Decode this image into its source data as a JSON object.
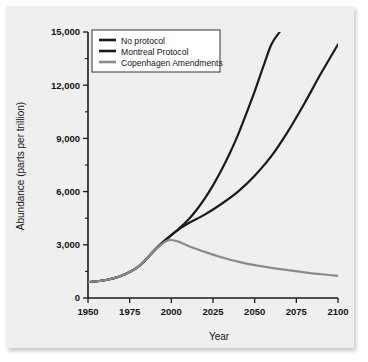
{
  "chart_data": {
    "type": "line",
    "title": "",
    "xlabel": "Year",
    "ylabel": "Abundance (parts per trillion)",
    "xlim": [
      1950,
      2100
    ],
    "ylim": [
      0,
      15000
    ],
    "grid": false,
    "legend_position": "top-left",
    "x_ticks": [
      "1950",
      "1975",
      "2000",
      "2025",
      "2050",
      "2075",
      "2100"
    ],
    "x_tick_values": [
      1950,
      1975,
      2000,
      2025,
      2050,
      2075,
      2100
    ],
    "y_ticks": [
      "0",
      "3,000",
      "6,000",
      "9,000",
      "12,000",
      "15,000"
    ],
    "y_tick_values": [
      0,
      3000,
      6000,
      9000,
      12000,
      15000
    ],
    "y_minor_tick_values": [
      1500,
      4500,
      7500,
      10500,
      13500
    ],
    "series": [
      {
        "name": "No protocol",
        "color": "#1a1a1a",
        "width": 2.2,
        "x": [
          1950,
          1960,
          1970,
          1980,
          1990,
          1995,
          2000,
          2005,
          2010,
          2015,
          2020,
          2025,
          2030,
          2035,
          2040,
          2045,
          2050,
          2055,
          2060,
          2065
        ],
        "values": [
          900,
          1000,
          1250,
          1750,
          2700,
          3150,
          3550,
          3950,
          4400,
          4950,
          5600,
          6350,
          7200,
          8150,
          9200,
          10400,
          11650,
          13000,
          14300,
          15000
        ]
      },
      {
        "name": "Montreal Protocol",
        "color": "#1a1a1a",
        "width": 2.2,
        "x": [
          1950,
          1960,
          1970,
          1980,
          1990,
          1995,
          2000,
          2005,
          2010,
          2020,
          2030,
          2040,
          2050,
          2060,
          2070,
          2080,
          2090,
          2100
        ],
        "values": [
          900,
          1000,
          1250,
          1750,
          2700,
          3150,
          3550,
          3900,
          4200,
          4700,
          5300,
          6000,
          6900,
          8000,
          9400,
          11000,
          12700,
          14300
        ]
      },
      {
        "name": "Copenhagen Amendments",
        "color": "#8a8a8a",
        "width": 2.2,
        "x": [
          1950,
          1960,
          1970,
          1980,
          1990,
          1995,
          1998,
          2000,
          2005,
          2010,
          2020,
          2030,
          2040,
          2050,
          2060,
          2070,
          2080,
          2090,
          2100
        ],
        "values": [
          900,
          1000,
          1250,
          1750,
          2700,
          3100,
          3250,
          3270,
          3150,
          2950,
          2600,
          2300,
          2050,
          1850,
          1700,
          1570,
          1450,
          1340,
          1250
        ]
      }
    ],
    "annotations": []
  },
  "legend": {
    "entries": [
      {
        "label": "No protocol"
      },
      {
        "label": "Montreal Protocol"
      },
      {
        "label": "Copenhagen Amendments"
      }
    ]
  }
}
